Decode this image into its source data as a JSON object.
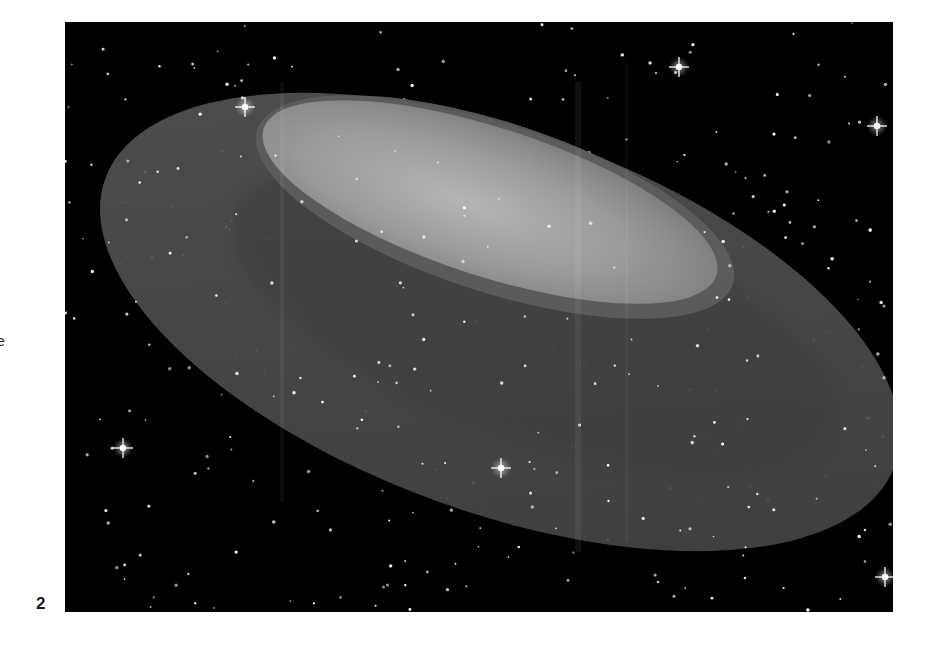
{
  "page": {
    "margin_fragment": "e",
    "figure_number": "2"
  },
  "figure": {
    "colors": {
      "space": "#000000",
      "torus_outer": "#4a4a4a",
      "torus_inner_shadow": "#3b3b3b",
      "hole_rim": "#606060",
      "hole_glow": "#9a9a9a",
      "star": "#ffffff"
    },
    "bright_stars": [
      {
        "x": 180,
        "y": 85
      },
      {
        "x": 614,
        "y": 45
      },
      {
        "x": 812,
        "y": 104
      },
      {
        "x": 58,
        "y": 426
      },
      {
        "x": 436,
        "y": 446
      },
      {
        "x": 820,
        "y": 555
      }
    ],
    "star_seed": 17,
    "star_count": 340
  }
}
